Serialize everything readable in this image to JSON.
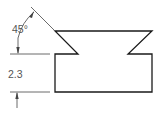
{
  "diagram": {
    "type": "technical-drawing",
    "colors": {
      "outline": "#1a1a1a",
      "dimension": "#444444",
      "text": "#555555"
    },
    "dimensions": {
      "angle": {
        "label": "45°"
      },
      "height": {
        "label": "2.3"
      }
    }
  }
}
